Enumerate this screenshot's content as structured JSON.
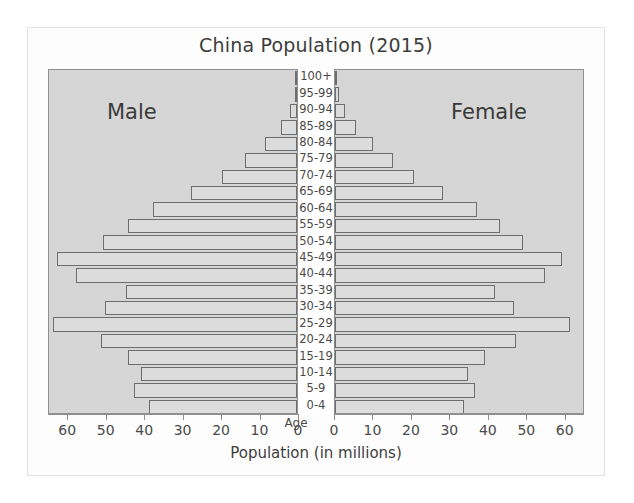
{
  "chart_data": {
    "type": "bar",
    "subtype": "population-pyramid",
    "title": "China Population (2015)",
    "xlabel": "Population (in millions)",
    "ylabel": "Age",
    "age_axis_label": "Age",
    "left_series_label": "Male",
    "right_series_label": "Female",
    "grid": false,
    "legend_position": "in-plot",
    "xlim": [
      0,
      65
    ],
    "xticks": [
      0,
      10,
      20,
      30,
      40,
      50,
      60
    ],
    "xtick_labels_left": [
      "60",
      "50",
      "40",
      "30",
      "20",
      "10",
      "0"
    ],
    "xtick_labels_right": [
      "0",
      "10",
      "20",
      "30",
      "40",
      "50",
      "60"
    ],
    "categories": [
      "100+",
      "95-99",
      "90-94",
      "85-89",
      "80-84",
      "75-79",
      "70-74",
      "65-69",
      "60-64",
      "55-59",
      "50-54",
      "45-49",
      "40-44",
      "35-39",
      "30-34",
      "25-29",
      "20-24",
      "15-19",
      "10-14",
      "5-9",
      "0-4"
    ],
    "series": [
      {
        "name": "Male",
        "side": "left",
        "values": [
          0.1,
          0.6,
          1.8,
          4.2,
          8.2,
          13.5,
          19.5,
          27.5,
          37.5,
          44.0,
          50.5,
          62.5,
          57.5,
          44.5,
          50.0,
          63.5,
          51.0,
          44.0,
          40.5,
          42.5,
          38.5
        ]
      },
      {
        "name": "Female",
        "side": "right",
        "values": [
          0.2,
          1.0,
          2.6,
          5.5,
          10.0,
          15.0,
          20.5,
          28.0,
          37.0,
          43.0,
          49.0,
          59.0,
          54.5,
          41.5,
          46.5,
          61.0,
          47.0,
          39.0,
          34.5,
          36.5,
          33.5
        ]
      }
    ]
  },
  "colors": {
    "panel_background": "#d6d6d6",
    "bar_fill": "#dcdcdc",
    "bar_stroke": "#6e6e6e",
    "card_background": "#fdfdfd",
    "text": "#3d3d3d"
  }
}
